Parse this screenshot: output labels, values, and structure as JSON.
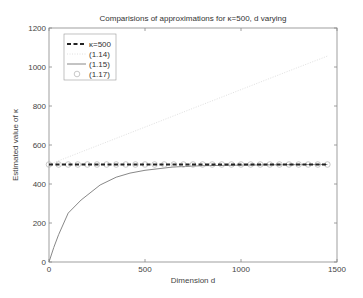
{
  "chart_data": {
    "type": "line",
    "title": "Comparisions of approximations for κ=500, d varying",
    "xlabel": "Dimension d",
    "ylabel": "Estimated value of κ",
    "xlim": [
      0,
      1500
    ],
    "ylim": [
      0,
      1200
    ],
    "xticks": [
      0,
      500,
      1000,
      1500
    ],
    "yticks": [
      0,
      200,
      400,
      600,
      800,
      1000,
      1200
    ],
    "grid": false,
    "legend_position": "upper left",
    "legend": [
      "κ=500",
      "(1.14)",
      "(1.15)",
      "(1.17)"
    ],
    "series": [
      {
        "name": "κ=500",
        "style": "dashed",
        "color": "#222222",
        "x": [
          0,
          1450
        ],
        "values": [
          500,
          500
        ]
      },
      {
        "name": "(1.14)",
        "style": "dotted",
        "color": "#e0e0e0",
        "x": [
          0,
          250,
          500,
          750,
          1000,
          1250,
          1450
        ],
        "values": [
          500,
          596,
          692,
          788,
          884,
          980,
          1056
        ]
      },
      {
        "name": "(1.15)",
        "style": "solid",
        "color": "#888888",
        "x": [
          0,
          25,
          50,
          100,
          167,
          266,
          350,
          422,
          500,
          646,
          800,
          1000,
          1250,
          1450
        ],
        "values": [
          0,
          75,
          140,
          251,
          318,
          395,
          435,
          456,
          470,
          487,
          494,
          497,
          499,
          500
        ]
      },
      {
        "name": "(1.17)",
        "style": "circle-markers",
        "color": "#bbbbbb",
        "x": [
          0,
          50,
          100,
          150,
          200,
          250,
          300,
          350,
          400,
          450,
          500,
          550,
          600,
          650,
          700,
          750,
          800,
          850,
          900,
          950,
          1000,
          1050,
          1100,
          1150,
          1200,
          1250,
          1300,
          1350,
          1400,
          1450
        ],
        "values": [
          500,
          500,
          500,
          500,
          500,
          500,
          500,
          500,
          500,
          500,
          500,
          500,
          500,
          500,
          500,
          500,
          500,
          500,
          500,
          500,
          500,
          500,
          500,
          500,
          500,
          500,
          500,
          500,
          500,
          500
        ]
      }
    ]
  }
}
